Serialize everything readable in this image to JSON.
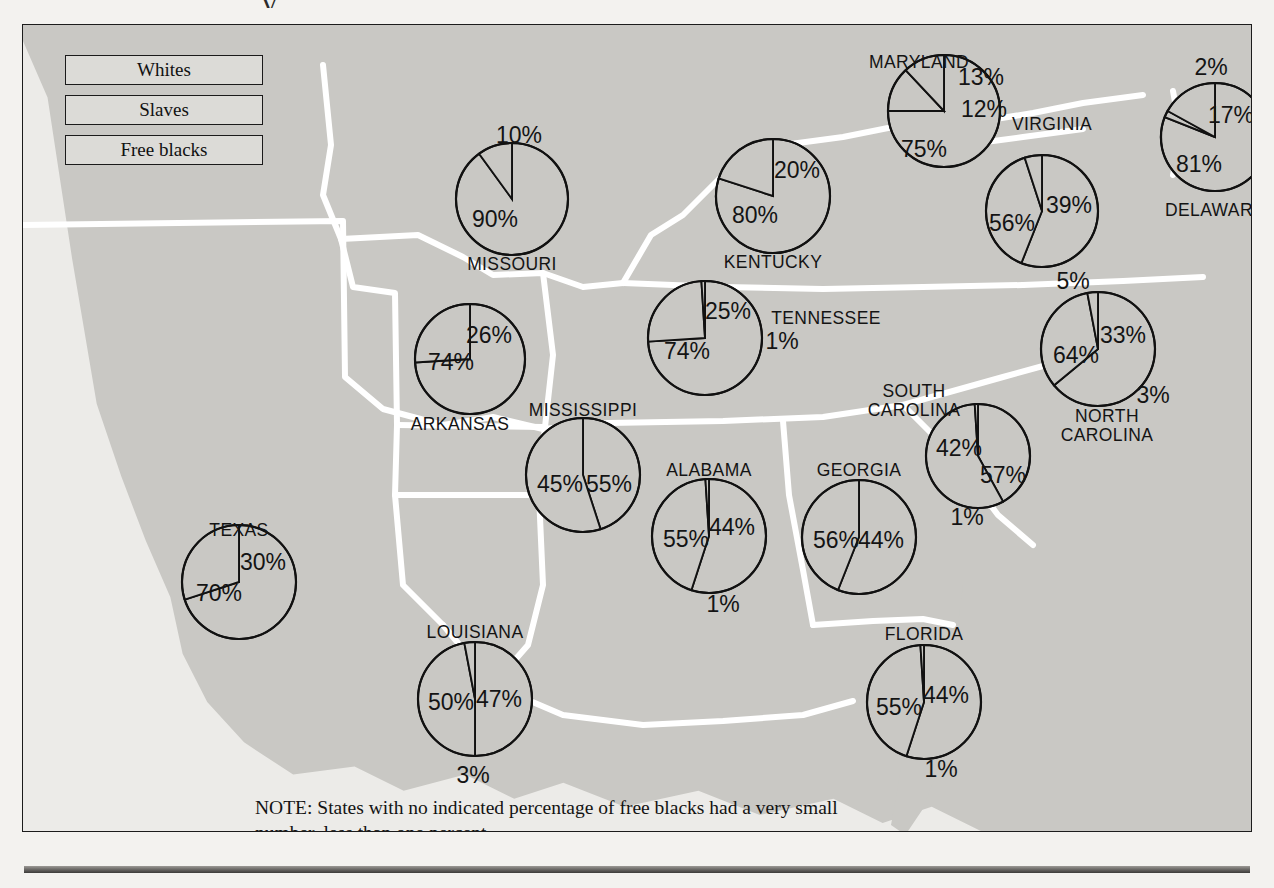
{
  "figure": {
    "title_remnant": "y",
    "note": "NOTE: States with no indicated percentage of free blacks had a very small number, less than one percent."
  },
  "legend": {
    "items": [
      {
        "label": "Whites",
        "key": "whites"
      },
      {
        "label": "Slaves",
        "key": "slaves"
      },
      {
        "label": "Free blacks",
        "key": "free_blacks"
      }
    ]
  },
  "chart_data": {
    "type": "pie",
    "categories": [
      "Whites",
      "Slaves",
      "Free blacks"
    ],
    "units": "percent",
    "note": "States with no indicated percentage of free blacks had a very small number, less than one percent.",
    "series": [
      {
        "name": "MISSOURI",
        "values": [
          90,
          10,
          null
        ],
        "labels": [
          "90%",
          "10%",
          null
        ]
      },
      {
        "name": "KENTUCKY",
        "values": [
          80,
          20,
          null
        ],
        "labels": [
          "80%",
          "20%",
          null
        ]
      },
      {
        "name": "MARYLAND",
        "values": [
          75,
          13,
          12
        ],
        "labels": [
          "75%",
          "13%",
          "12%"
        ]
      },
      {
        "name": "VIRGINIA",
        "values": [
          56,
          39,
          5
        ],
        "labels": [
          "56%",
          "39%",
          "5%"
        ]
      },
      {
        "name": "DELAWARE",
        "values": [
          81,
          2,
          17
        ],
        "labels": [
          "81%",
          "2%",
          "17%"
        ]
      },
      {
        "name": "TENNESSEE",
        "values": [
          74,
          25,
          1
        ],
        "labels": [
          "74%",
          "25%",
          "1%"
        ]
      },
      {
        "name": "NORTH CAROLINA",
        "values": [
          64,
          33,
          3
        ],
        "labels": [
          "64%",
          "33%",
          "3%"
        ]
      },
      {
        "name": "ARKANSAS",
        "values": [
          74,
          26,
          null
        ],
        "labels": [
          "74%",
          "26%",
          null
        ]
      },
      {
        "name": "MISSISSIPPI",
        "values": [
          45,
          55,
          null
        ],
        "labels": [
          "45%",
          "55%",
          null
        ]
      },
      {
        "name": "SOUTH CAROLINA",
        "values": [
          42,
          57,
          1
        ],
        "labels": [
          "42%",
          "57%",
          "1%"
        ]
      },
      {
        "name": "ALABAMA",
        "values": [
          55,
          44,
          1
        ],
        "labels": [
          "55%",
          "44%",
          "1%"
        ]
      },
      {
        "name": "GEORGIA",
        "values": [
          56,
          44,
          null
        ],
        "labels": [
          "56%",
          "44%",
          null
        ]
      },
      {
        "name": "TEXAS",
        "values": [
          70,
          30,
          null
        ],
        "labels": [
          "70%",
          "30%",
          null
        ]
      },
      {
        "name": "LOUISIANA",
        "values": [
          50,
          47,
          3
        ],
        "labels": [
          "50%",
          "47%",
          "3%"
        ]
      },
      {
        "name": "FLORIDA",
        "values": [
          55,
          44,
          1
        ],
        "labels": [
          "55%",
          "44%",
          "1%"
        ]
      }
    ]
  },
  "pies": {
    "missouri": {
      "name": "MISSOURI",
      "cx": 489,
      "cy": 174,
      "r": 56,
      "name_pos": {
        "x": 489,
        "y": 240
      },
      "labels": [
        {
          "t": "90%",
          "x": 472,
          "y": 196
        },
        {
          "t": "10%",
          "x": 496,
          "y": 112
        }
      ]
    },
    "kentucky": {
      "name": "KENTUCKY",
      "cx": 750,
      "cy": 171,
      "r": 57,
      "name_pos": {
        "x": 750,
        "y": 238
      },
      "labels": [
        {
          "t": "80%",
          "x": 732,
          "y": 192
        },
        {
          "t": "20%",
          "x": 774,
          "y": 147
        }
      ]
    },
    "maryland": {
      "name": "MARYLAND",
      "cx": 921,
      "cy": 86,
      "r": 56,
      "name_pos": {
        "x": 896,
        "y": 38
      },
      "labels": [
        {
          "t": "75%",
          "x": 901,
          "y": 126
        },
        {
          "t": "13%",
          "x": 958,
          "y": 54
        },
        {
          "t": "12%",
          "x": 961,
          "y": 86
        }
      ]
    },
    "virginia": {
      "name": "VIRGINIA",
      "cx": 1019,
      "cy": 186,
      "r": 56,
      "name_pos": {
        "x": 1029,
        "y": 100
      },
      "labels": [
        {
          "t": "56%",
          "x": 989,
          "y": 200
        },
        {
          "t": "39%",
          "x": 1046,
          "y": 182
        },
        {
          "t": "5%",
          "x": 1050,
          "y": 258
        }
      ]
    },
    "delaware": {
      "name": "DELAWARE",
      "cx": 1192,
      "cy": 112,
      "r": 54,
      "name_pos": {
        "x": 1192,
        "y": 186
      },
      "labels": [
        {
          "t": "81%",
          "x": 1176,
          "y": 141
        },
        {
          "t": "2%",
          "x": 1188,
          "y": 44
        },
        {
          "t": "17%",
          "x": 1208,
          "y": 92
        }
      ]
    },
    "tennessee": {
      "name": "TENNESSEE",
      "cx": 682,
      "cy": 313,
      "r": 57,
      "name_pos": {
        "x": 803,
        "y": 294
      },
      "labels": [
        {
          "t": "74%",
          "x": 664,
          "y": 328
        },
        {
          "t": "25%",
          "x": 705,
          "y": 288
        },
        {
          "t": "1%",
          "x": 759,
          "y": 318
        }
      ]
    },
    "north_carolina": {
      "name": "NORTH\nCAROLINA",
      "cx": 1075,
      "cy": 324,
      "r": 57,
      "name_pos": {
        "x": 1084,
        "y": 392
      },
      "labels": [
        {
          "t": "64%",
          "x": 1053,
          "y": 332
        },
        {
          "t": "33%",
          "x": 1100,
          "y": 312
        },
        {
          "t": "3%",
          "x": 1130,
          "y": 372
        }
      ]
    },
    "arkansas": {
      "name": "ARKANSAS",
      "cx": 447,
      "cy": 334,
      "r": 55,
      "name_pos": {
        "x": 437,
        "y": 400
      },
      "labels": [
        {
          "t": "74%",
          "x": 428,
          "y": 339
        },
        {
          "t": "26%",
          "x": 466,
          "y": 312
        }
      ]
    },
    "mississippi": {
      "name": "MISSISSIPPI",
      "cx": 560,
      "cy": 450,
      "r": 57,
      "name_pos": {
        "x": 560,
        "y": 386
      },
      "labels": [
        {
          "t": "45%",
          "x": 537,
          "y": 461
        },
        {
          "t": "55%",
          "x": 586,
          "y": 461
        }
      ]
    },
    "south_carolina": {
      "name": "SOUTH\nCAROLINA",
      "cx": 955,
      "cy": 431,
      "r": 52,
      "name_pos": {
        "x": 891,
        "y": 367
      },
      "labels": [
        {
          "t": "42%",
          "x": 936,
          "y": 425
        },
        {
          "t": "57%",
          "x": 980,
          "y": 452
        },
        {
          "t": "1%",
          "x": 944,
          "y": 494
        }
      ]
    },
    "alabama": {
      "name": "ALABAMA",
      "cx": 686,
      "cy": 511,
      "r": 57,
      "name_pos": {
        "x": 686,
        "y": 446
      },
      "labels": [
        {
          "t": "55%",
          "x": 663,
          "y": 516
        },
        {
          "t": "44%",
          "x": 709,
          "y": 504
        },
        {
          "t": "1%",
          "x": 700,
          "y": 581
        }
      ]
    },
    "georgia": {
      "name": "GEORGIA",
      "cx": 836,
      "cy": 512,
      "r": 57,
      "name_pos": {
        "x": 836,
        "y": 446
      },
      "labels": [
        {
          "t": "56%",
          "x": 813,
          "y": 517
        },
        {
          "t": "44%",
          "x": 858,
          "y": 517
        }
      ]
    },
    "texas": {
      "name": "TEXAS",
      "cx": 216,
      "cy": 557,
      "r": 57,
      "name_pos": {
        "x": 216,
        "y": 506
      },
      "labels": [
        {
          "t": "70%",
          "x": 196,
          "y": 570
        },
        {
          "t": "30%",
          "x": 240,
          "y": 539
        }
      ]
    },
    "louisiana": {
      "name": "LOUISIANA",
      "cx": 452,
      "cy": 674,
      "r": 57,
      "name_pos": {
        "x": 452,
        "y": 608
      },
      "labels": [
        {
          "t": "50%",
          "x": 428,
          "y": 679
        },
        {
          "t": "47%",
          "x": 476,
          "y": 676
        },
        {
          "t": "3%",
          "x": 450,
          "y": 752
        }
      ]
    },
    "florida": {
      "name": "FLORIDA",
      "cx": 901,
      "cy": 677,
      "r": 57,
      "name_pos": {
        "x": 901,
        "y": 610
      },
      "labels": [
        {
          "t": "55%",
          "x": 876,
          "y": 684
        },
        {
          "t": "44%",
          "x": 923,
          "y": 672
        },
        {
          "t": "1%",
          "x": 918,
          "y": 746
        }
      ]
    }
  }
}
